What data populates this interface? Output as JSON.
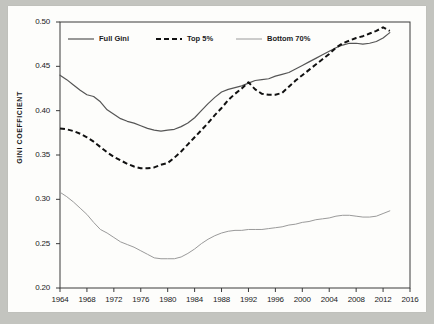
{
  "chart_data": {
    "type": "line",
    "title": "",
    "xlabel": "",
    "ylabel": "GINI COEFFICIENT",
    "xlim": [
      1964,
      2016
    ],
    "ylim": [
      0.2,
      0.5
    ],
    "grid": false,
    "legend_position": "top-left-inside",
    "xticks": [
      1964,
      1968,
      1972,
      1976,
      1980,
      1984,
      1988,
      1992,
      1996,
      2000,
      2004,
      2008,
      2012,
      2016
    ],
    "yticks": [
      "0.20",
      "0.25",
      "0.30",
      "0.35",
      "0.40",
      "0.45",
      "0.50"
    ],
    "x": [
      1964,
      1965,
      1966,
      1967,
      1968,
      1969,
      1970,
      1971,
      1972,
      1973,
      1974,
      1975,
      1976,
      1977,
      1978,
      1979,
      1980,
      1981,
      1982,
      1983,
      1984,
      1985,
      1986,
      1987,
      1988,
      1989,
      1990,
      1991,
      1992,
      1993,
      1994,
      1995,
      1996,
      1997,
      1998,
      1999,
      2000,
      2001,
      2002,
      2003,
      2004,
      2005,
      2006,
      2007,
      2008,
      2009,
      2010,
      2011,
      2012,
      2013
    ],
    "series": [
      {
        "name": "Full Gini",
        "style": "solid",
        "color": "#555555",
        "values": [
          0.44,
          0.435,
          0.429,
          0.423,
          0.418,
          0.416,
          0.41,
          0.401,
          0.396,
          0.391,
          0.388,
          0.386,
          0.383,
          0.38,
          0.378,
          0.377,
          0.378,
          0.379,
          0.382,
          0.386,
          0.392,
          0.4,
          0.408,
          0.415,
          0.421,
          0.424,
          0.426,
          0.428,
          0.431,
          0.434,
          0.435,
          0.436,
          0.439,
          0.441,
          0.443,
          0.447,
          0.451,
          0.455,
          0.459,
          0.463,
          0.467,
          0.471,
          0.474,
          0.476,
          0.476,
          0.475,
          0.476,
          0.478,
          0.482,
          0.488
        ]
      },
      {
        "name": "Top 5%",
        "style": "dashed",
        "color": "#111111",
        "values": [
          0.38,
          0.379,
          0.377,
          0.374,
          0.37,
          0.365,
          0.359,
          0.353,
          0.348,
          0.344,
          0.34,
          0.337,
          0.335,
          0.335,
          0.336,
          0.339,
          0.341,
          0.347,
          0.354,
          0.362,
          0.37,
          0.378,
          0.386,
          0.395,
          0.403,
          0.412,
          0.419,
          0.425,
          0.432,
          0.424,
          0.419,
          0.418,
          0.418,
          0.42,
          0.427,
          0.434,
          0.44,
          0.446,
          0.452,
          0.458,
          0.464,
          0.471,
          0.476,
          0.479,
          0.482,
          0.484,
          0.487,
          0.49,
          0.494,
          0.49
        ]
      },
      {
        "name": "Bottom 70%",
        "style": "solid-light",
        "color": "#9a9a9a",
        "values": [
          0.308,
          0.303,
          0.297,
          0.29,
          0.283,
          0.274,
          0.266,
          0.262,
          0.257,
          0.252,
          0.249,
          0.246,
          0.242,
          0.238,
          0.234,
          0.233,
          0.233,
          0.233,
          0.235,
          0.239,
          0.244,
          0.25,
          0.255,
          0.259,
          0.262,
          0.264,
          0.265,
          0.265,
          0.266,
          0.266,
          0.266,
          0.267,
          0.268,
          0.269,
          0.271,
          0.272,
          0.274,
          0.275,
          0.277,
          0.278,
          0.279,
          0.281,
          0.282,
          0.282,
          0.281,
          0.28,
          0.28,
          0.281,
          0.284,
          0.287
        ]
      }
    ]
  }
}
